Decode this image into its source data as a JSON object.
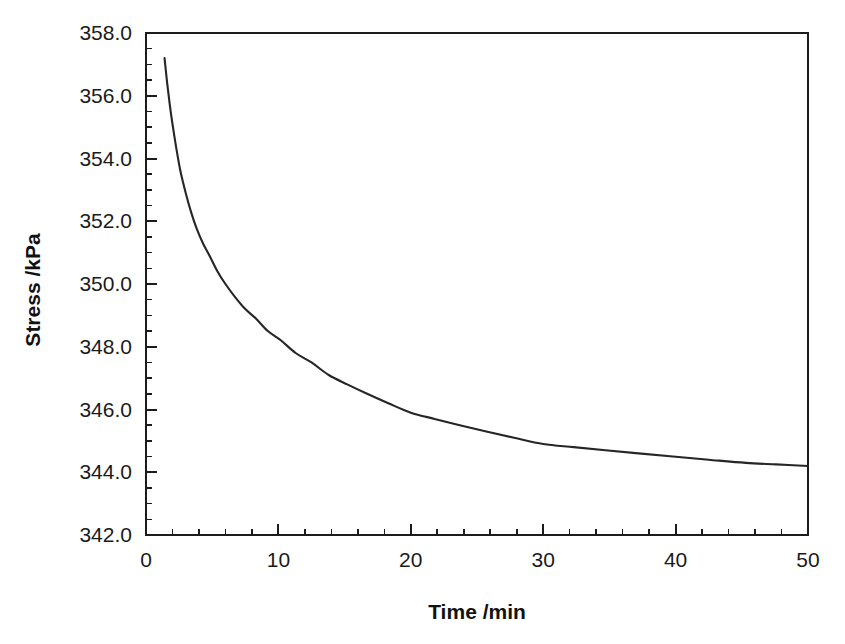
{
  "chart_data": {
    "type": "line",
    "title": "",
    "xlabel": "Time /min",
    "ylabel": "Stress /kPa",
    "xlim": [
      0,
      50
    ],
    "ylim": [
      342.0,
      358.0
    ],
    "grid": false,
    "legend": null,
    "x_ticks": [
      0,
      10,
      20,
      30,
      40,
      50
    ],
    "x_tick_labels": [
      "0",
      "10",
      "20",
      "30",
      "40",
      "50"
    ],
    "x_minor_step": 2,
    "y_ticks": [
      342.0,
      344.0,
      346.0,
      348.0,
      350.0,
      352.0,
      354.0,
      356.0,
      358.0
    ],
    "y_tick_labels": [
      "342.0",
      "344.0",
      "346.0",
      "348.0",
      "350.0",
      "352.0",
      "354.0",
      "356.0",
      "358.0"
    ],
    "y_minor_step": 0.5,
    "series": [
      {
        "name": "Stress relaxation",
        "color": "#262626",
        "x": [
          1.4,
          1.6,
          1.8,
          2.0,
          2.3,
          2.6,
          3.0,
          3.4,
          3.8,
          4.3,
          4.8,
          5.4,
          6.0,
          6.7,
          7.5,
          8.3,
          9.2,
          10.2,
          11.3,
          12.5,
          13.8,
          15.2,
          16.7,
          18.3,
          20.0,
          21.8,
          23.7,
          25.7,
          27.8,
          30.0,
          32.3,
          34.7,
          37.2,
          39.8,
          42.5,
          45.3,
          47.6,
          50.0
        ],
        "y": [
          357.2,
          356.4,
          355.7,
          355.1,
          354.3,
          353.6,
          352.9,
          352.3,
          351.8,
          351.3,
          350.9,
          350.4,
          350.0,
          349.6,
          349.2,
          348.9,
          348.5,
          348.2,
          347.8,
          347.5,
          347.1,
          346.8,
          346.5,
          346.2,
          345.9,
          345.7,
          345.5,
          345.3,
          345.1,
          344.9,
          344.8,
          344.7,
          344.6,
          344.5,
          344.4,
          344.3,
          344.25,
          344.2
        ]
      }
    ]
  },
  "axis_titles": {
    "x": "Time /min",
    "y": "Stress /kPa"
  },
  "scan_artifacts": {
    "bottom_caption_ghost": "Figure"
  }
}
